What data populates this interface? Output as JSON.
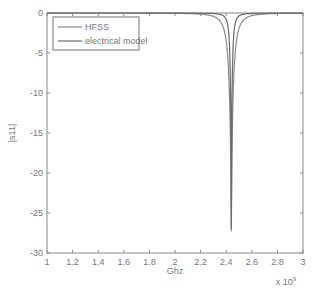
{
  "chart_data": {
    "type": "line",
    "title": "",
    "xlabel": "Ghz",
    "ylabel": "|s11|",
    "x_multiplier_label": "x 10",
    "x_multiplier_exp": "9",
    "xlim": [
      1,
      3
    ],
    "ylim": [
      -30,
      0
    ],
    "xticks": [
      "1",
      "1.2",
      "1.4",
      "1.6",
      "1.8",
      "2",
      "2.2",
      "2.4",
      "2.6",
      "2.8",
      "3"
    ],
    "xtick_values": [
      1,
      1.2,
      1.4,
      1.6,
      1.8,
      2,
      2.2,
      2.4,
      2.6,
      2.8,
      3
    ],
    "yticks": [
      "0",
      "-5",
      "-10",
      "-15",
      "-20",
      "-25",
      "-30"
    ],
    "ytick_values": [
      0,
      -5,
      -10,
      -15,
      -20,
      -25,
      -30
    ],
    "grid": false,
    "legend_position": "top-left",
    "series": [
      {
        "name": "HFSS",
        "center": 2.44,
        "min_db": -27.3,
        "width": 0.045,
        "color": "#8a8a8a"
      },
      {
        "name": "electrical model",
        "center": 2.44,
        "min_db": -27.0,
        "width": 0.018,
        "color": "#6a6a6a"
      }
    ]
  }
}
